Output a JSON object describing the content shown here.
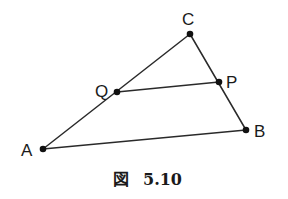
{
  "diagram": {
    "points": {
      "A": {
        "label": "A",
        "x": 43,
        "y": 149
      },
      "B": {
        "label": "B",
        "x": 246,
        "y": 130
      },
      "C": {
        "label": "C",
        "x": 190,
        "y": 34
      },
      "Q": {
        "label": "Q",
        "x": 117,
        "y": 92
      },
      "P": {
        "label": "P",
        "x": 219,
        "y": 82
      }
    },
    "segments": [
      {
        "from": "A",
        "to": "C"
      },
      {
        "from": "C",
        "to": "B"
      },
      {
        "from": "A",
        "to": "B"
      },
      {
        "from": "Q",
        "to": "P"
      }
    ],
    "caption": {
      "prefix": "図",
      "number": "5.10"
    },
    "colors": {
      "stroke": "#2a2a2a",
      "dot": "#111111",
      "text": "#1a1a1a",
      "background": "#ffffff"
    }
  }
}
